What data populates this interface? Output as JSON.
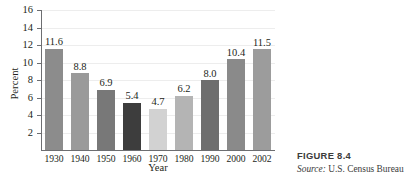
{
  "chart_data": {
    "type": "bar",
    "title": "",
    "xlabel": "Year",
    "ylabel": "Percent",
    "categories": [
      "1930",
      "1940",
      "1950",
      "1960",
      "1970",
      "1980",
      "1990",
      "2000",
      "2002"
    ],
    "values": [
      11.6,
      8.8,
      6.9,
      5.4,
      4.7,
      6.2,
      8.0,
      10.4,
      11.5
    ],
    "value_labels": [
      "11.6",
      "8.8",
      "6.9",
      "5.4",
      "4.7",
      "6.2",
      "8.0",
      "10.4",
      "11.5"
    ],
    "bar_colors": [
      "#8c8c8c",
      "#9a9a9a",
      "#787878",
      "#3d3d3d",
      "#d2d2d2",
      "#b4b4b4",
      "#6e6e6e",
      "#8a8a8a",
      "#9c9c9c"
    ],
    "ylim": [
      0,
      16
    ],
    "yticks": [
      2,
      4,
      6,
      8,
      10,
      12,
      14,
      16
    ],
    "ytick_labels": [
      "2",
      "4",
      "6",
      "8",
      "10",
      "12",
      "14",
      "16"
    ],
    "grid": true,
    "legend": "none",
    "axis_color": "#6d6e71",
    "gridline_color": "#ededed"
  },
  "caption": {
    "figure_number": "FIGURE 8.4",
    "source_label": "Source:",
    "source_text": "U.S. Census Bureau"
  }
}
